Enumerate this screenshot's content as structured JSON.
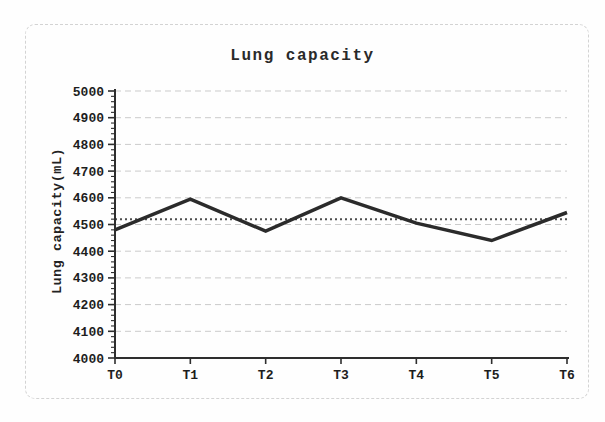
{
  "figure": {
    "background_color": "#fefefe",
    "border_color": "#d3d3d3"
  },
  "chart_data": {
    "type": "line",
    "title": "Lung capacity",
    "xlabel": "",
    "ylabel": "Lung capacity(mL)",
    "categories": [
      "T0",
      "T1",
      "T2",
      "T3",
      "T4",
      "T5",
      "T6"
    ],
    "series": [
      {
        "name": "Lung capacity",
        "values": [
          4480,
          4595,
          4475,
          4600,
          4505,
          4440,
          4545
        ]
      }
    ],
    "reference_line": {
      "value": 4520,
      "style": "dotted"
    },
    "ylim": [
      4000,
      5000
    ],
    "yticks": [
      4000,
      4100,
      4200,
      4300,
      4400,
      4500,
      4600,
      4700,
      4800,
      4900,
      5000
    ],
    "minor_tick_interval": 20,
    "grid": true,
    "legend": "none",
    "colors": {
      "series": "#2b2b2b",
      "reference": "#4d4d4d",
      "grid": "#cbcbcb",
      "axis": "#2e2e2e",
      "text": "#1d1d1d"
    }
  }
}
